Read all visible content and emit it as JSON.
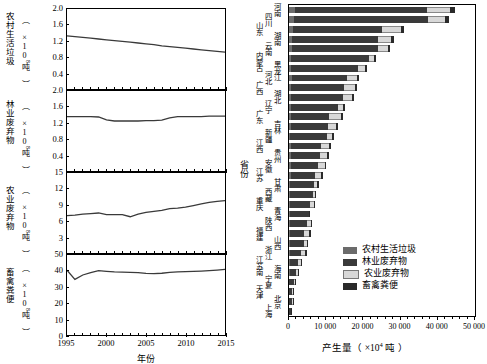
{
  "chart_data": [
    {
      "type": "line",
      "panel_index": 0,
      "title": "农村生活垃圾",
      "ylabel": "农村生活垃圾",
      "yunit": "（ ×10⁸吨 ）",
      "xlabel": "年份",
      "ylim": [
        0,
        2.0
      ],
      "yticks": [
        0.4,
        0.8,
        1.2,
        1.6,
        2.0
      ],
      "ytick_labels": [
        "0.4",
        "0.8",
        "1.2",
        "1.6",
        "2.0"
      ],
      "xlim": [
        1995,
        2015
      ],
      "xticks": [
        1995,
        2000,
        2005,
        2010,
        2015
      ],
      "x": [
        1995,
        1996,
        1997,
        1998,
        1999,
        2000,
        2001,
        2002,
        2003,
        2004,
        2005,
        2006,
        2007,
        2008,
        2009,
        2010,
        2011,
        2012,
        2013,
        2014,
        2015
      ],
      "values": [
        1.33,
        1.31,
        1.29,
        1.27,
        1.25,
        1.23,
        1.21,
        1.19,
        1.17,
        1.15,
        1.13,
        1.11,
        1.08,
        1.06,
        1.04,
        1.02,
        1.0,
        0.98,
        0.96,
        0.94,
        0.92
      ]
    },
    {
      "type": "line",
      "panel_index": 1,
      "title": "林业废弃物",
      "ylabel": "林业废弃物",
      "yunit": "（ ×10⁸吨 ）",
      "xlabel": "年份",
      "ylim": [
        0,
        2.0
      ],
      "yticks": [
        0.4,
        0.8,
        1.2,
        1.6,
        2.0
      ],
      "ytick_labels": [
        "0.4",
        "0.8",
        "1.2",
        "1.6",
        "2.0"
      ],
      "xlim": [
        1995,
        2015
      ],
      "xticks": [
        1995,
        2000,
        2005,
        2010,
        2015
      ],
      "x": [
        1995,
        1996,
        1997,
        1998,
        1999,
        2000,
        2001,
        2002,
        2003,
        2004,
        2005,
        2006,
        2007,
        2008,
        2009,
        2010,
        2011,
        2012,
        2013,
        2014,
        2015
      ],
      "values": [
        1.36,
        1.36,
        1.36,
        1.36,
        1.35,
        1.28,
        1.25,
        1.25,
        1.25,
        1.25,
        1.26,
        1.26,
        1.27,
        1.33,
        1.36,
        1.36,
        1.36,
        1.36,
        1.37,
        1.37,
        1.37
      ]
    },
    {
      "type": "line",
      "panel_index": 2,
      "title": "农业废弃物",
      "ylabel": "农业废弃物",
      "yunit": "（ ×10⁸吨 ）",
      "xlabel": "年份",
      "ylim": [
        0,
        15
      ],
      "yticks": [
        3,
        6,
        9,
        12,
        15
      ],
      "ytick_labels": [
        "3",
        "6",
        "9",
        "12",
        "15"
      ],
      "xlim": [
        1995,
        2015
      ],
      "xticks": [
        1995,
        2000,
        2005,
        2010,
        2015
      ],
      "x": [
        1995,
        1996,
        1997,
        1998,
        1999,
        2000,
        2001,
        2002,
        2003,
        2004,
        2005,
        2006,
        2007,
        2008,
        2009,
        2010,
        2011,
        2012,
        2013,
        2014,
        2015
      ],
      "values": [
        7.0,
        7.1,
        7.3,
        7.4,
        7.5,
        7.2,
        7.2,
        7.2,
        6.8,
        7.3,
        7.6,
        7.8,
        8.0,
        8.3,
        8.4,
        8.6,
        8.9,
        9.2,
        9.5,
        9.7,
        9.8
      ]
    },
    {
      "type": "line",
      "panel_index": 3,
      "title": "畜禽粪便",
      "ylabel": "畜禽粪便",
      "yunit": "（ ×10⁸吨 ）",
      "xlabel": "年份",
      "ylim": [
        0,
        50
      ],
      "yticks": [
        0,
        10,
        20,
        30,
        40,
        50
      ],
      "ytick_labels": [
        "0",
        "10",
        "20",
        "30",
        "40",
        "50"
      ],
      "xlim": [
        1995,
        2015
      ],
      "xticks": [
        1995,
        2000,
        2005,
        2010,
        2015
      ],
      "x": [
        1995,
        1996,
        1997,
        1998,
        1999,
        2000,
        2001,
        2002,
        2003,
        2004,
        2005,
        2006,
        2007,
        2008,
        2009,
        2010,
        2011,
        2012,
        2013,
        2014,
        2015
      ],
      "values": [
        40.5,
        34.8,
        37.5,
        39.0,
        40.3,
        39.8,
        39.4,
        39.3,
        39.2,
        39.0,
        38.5,
        38.3,
        38.6,
        39.2,
        39.5,
        39.6,
        39.7,
        39.9,
        40.2,
        40.6,
        41.0
      ]
    },
    {
      "type": "bar",
      "orientation": "horizontal",
      "stacked": true,
      "panel_index": 4,
      "xlabel": "产生量（ ×10⁴吨 ）",
      "ylabel": "省份",
      "xlim": [
        0,
        50000
      ],
      "xticks": [
        0,
        10000,
        20000,
        30000,
        40000,
        50000
      ],
      "xtick_labels": [
        "0",
        "10 000",
        "20 000",
        "30 000",
        "40 000",
        "50 000"
      ],
      "series": [
        {
          "name": "农村生活垃圾",
          "color": "#6b6b6b"
        },
        {
          "name": "林业废弃物",
          "color": "#3a3a3a"
        },
        {
          "name": "农业废弃物",
          "color": "#d8d8d8"
        },
        {
          "name": "畜禽粪便",
          "color": "#2a2a2a"
        }
      ],
      "categories": [
        "河南",
        "四川",
        "山东",
        "湖南",
        "云南",
        "内蒙古",
        "黑龙江",
        "河北",
        "广西",
        "湖北",
        "辽宁",
        "广东",
        "吉林",
        "新疆",
        "江西",
        "贵州",
        "安徽",
        "江苏",
        "甘肃",
        "西藏",
        "重庆",
        "青海",
        "陕西",
        "福建",
        "山西",
        "浙江",
        "江苏南",
        "海南",
        "宁夏",
        "天津",
        "北京",
        "上海"
      ],
      "stacks": [
        [
          1500,
          35500,
          6200,
          1300
        ],
        [
          1450,
          35900,
          4500,
          1100
        ],
        [
          1100,
          23900,
          5100,
          900
        ],
        [
          900,
          23100,
          3400,
          800
        ],
        [
          850,
          23200,
          2500,
          700
        ],
        [
          650,
          20800,
          1300,
          600
        ],
        [
          620,
          17900,
          1900,
          560
        ],
        [
          700,
          14800,
          2700,
          700
        ],
        [
          600,
          14300,
          2800,
          600
        ],
        [
          600,
          13900,
          2500,
          560
        ],
        [
          500,
          12700,
          1400,
          500
        ],
        [
          600,
          10100,
          3300,
          600
        ],
        [
          450,
          10000,
          2300,
          480
        ],
        [
          380,
          9800,
          1400,
          420
        ],
        [
          420,
          8200,
          2200,
          430
        ],
        [
          430,
          8000,
          1800,
          400
        ],
        [
          450,
          7400,
          1700,
          420
        ],
        [
          420,
          6600,
          1600,
          400
        ],
        [
          380,
          6300,
          900,
          360
        ],
        [
          180,
          6400,
          300,
          200
        ],
        [
          330,
          5200,
          1100,
          330
        ],
        [
          160,
          5100,
          250,
          180
        ],
        [
          330,
          4400,
          1200,
          330
        ],
        [
          300,
          3700,
          1500,
          320
        ],
        [
          300,
          3800,
          800,
          300
        ],
        [
          330,
          2900,
          1200,
          330
        ],
        [
          200,
          2300,
          700,
          220
        ],
        [
          150,
          1700,
          500,
          170
        ],
        [
          110,
          1250,
          330,
          120
        ],
        [
          120,
          700,
          280,
          120
        ],
        [
          130,
          560,
          260,
          130
        ],
        [
          120,
          330,
          180,
          110
        ]
      ]
    }
  ],
  "panels": {
    "p0": {
      "label": "农村生活垃圾",
      "unit": "（ ×10",
      "unit_exp": "8",
      "unit_tail": "吨 ）"
    },
    "p1": {
      "label": "林业废弃物",
      "unit": "（ ×10",
      "unit_exp": "8",
      "unit_tail": "吨 ）"
    },
    "p2": {
      "label": "农业废弃物",
      "unit": "（ ×10",
      "unit_exp": "8",
      "unit_tail": "吨 ）"
    },
    "p3": {
      "label": "畜禽粪便",
      "unit": "（ ×10",
      "unit_exp": "8",
      "unit_tail": "吨 ）"
    }
  },
  "axes": {
    "left_x_title": "年份",
    "right_x_title_main": "产生量（ ×10",
    "right_x_title_exp": "4",
    "right_x_title_tail": " 吨 ）",
    "right_y_title": "省份"
  },
  "legend": {
    "items": [
      {
        "label": "农村生活垃圾",
        "color": "#6b6b6b"
      },
      {
        "label": "林业废弃物",
        "color": "#3a3a3a"
      },
      {
        "label": "农业废弃物",
        "color": "#d8d8d8"
      },
      {
        "label": "畜禽粪便",
        "color": "#2a2a2a"
      }
    ]
  }
}
